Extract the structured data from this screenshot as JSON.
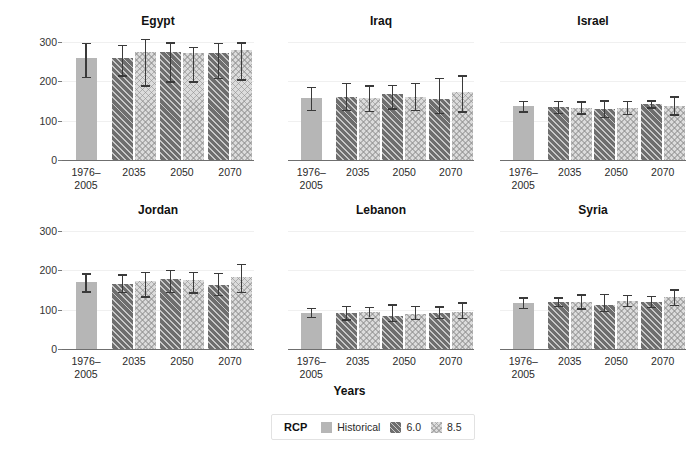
{
  "chart_data": {
    "type": "bar",
    "title": "",
    "xlabel": "Years",
    "ylabel": "Consecutive days without precipitation",
    "ylim": [
      0,
      320
    ],
    "yticks": [
      0,
      100,
      200,
      300
    ],
    "grid": false,
    "legend_position": "bottom-center",
    "legend_title": "RCP",
    "categories": [
      "1976–2005",
      "2035",
      "2050",
      "2070"
    ],
    "series_names": [
      "Historical",
      "6.0",
      "8.5"
    ],
    "panels": [
      {
        "name": "Egypt",
        "series": [
          {
            "name": "Historical",
            "values": [
              259,
              null,
              null,
              null
            ],
            "err_low": [
              212,
              null,
              null,
              null
            ],
            "err_high": [
              297,
              null,
              null,
              null
            ]
          },
          {
            "name": "6.0",
            "values": [
              null,
              259,
              274,
              272
            ],
            "err_low": [
              null,
              215,
              200,
              209
            ],
            "err_high": [
              null,
              293,
              299,
              297
            ]
          },
          {
            "name": "8.5",
            "values": [
              null,
              275,
              273,
              280
            ],
            "err_low": [
              null,
              190,
              200,
              205
            ],
            "err_high": [
              null,
              308,
              288,
              299
            ]
          }
        ]
      },
      {
        "name": "Iraq",
        "series": [
          {
            "name": "Historical",
            "values": [
              157,
              null,
              null,
              null
            ],
            "err_low": [
              128,
              null,
              null,
              null
            ],
            "err_high": [
              186,
              null,
              null,
              null
            ]
          },
          {
            "name": "6.0",
            "values": [
              null,
              160,
              168,
              155
            ],
            "err_low": [
              null,
              128,
              131,
              120
            ],
            "err_high": [
              null,
              196,
              191,
              208
            ]
          },
          {
            "name": "8.5",
            "values": [
              null,
              157,
              161,
              172
            ],
            "err_low": [
              null,
              125,
              128,
              124
            ],
            "err_high": [
              null,
              190,
              196,
              215
            ]
          }
        ]
      },
      {
        "name": "Israel",
        "series": [
          {
            "name": "Historical",
            "values": [
              137,
              null,
              null,
              null
            ],
            "err_low": [
              124,
              null,
              null,
              null
            ],
            "err_high": [
              151,
              null,
              null,
              null
            ]
          },
          {
            "name": "6.0",
            "values": [
              null,
              134,
              129,
              143
            ],
            "err_low": [
              null,
              120,
              110,
              134
            ],
            "err_high": [
              null,
              150,
              152,
              152
            ]
          },
          {
            "name": "8.5",
            "values": [
              null,
              133,
              131,
              138
            ],
            "err_low": [
              null,
              119,
              117,
              116
            ],
            "err_high": [
              null,
              149,
              150,
              162
            ]
          }
        ]
      },
      {
        "name": "Jordan",
        "series": [
          {
            "name": "Historical",
            "values": [
              171,
              null,
              null,
              null
            ],
            "err_low": [
              147,
              null,
              null,
              null
            ],
            "err_high": [
              192,
              null,
              null,
              null
            ]
          },
          {
            "name": "6.0",
            "values": [
              null,
              164,
              177,
              163
            ],
            "err_low": [
              null,
              145,
              146,
              138
            ],
            "err_high": [
              null,
              190,
              201,
              194
            ]
          },
          {
            "name": "8.5",
            "values": [
              null,
              172,
              176,
              184
            ],
            "err_low": [
              null,
              134,
              144,
              145
            ],
            "err_high": [
              null,
              196,
              196,
              216
            ]
          }
        ]
      },
      {
        "name": "Lebanon",
        "series": [
          {
            "name": "Historical",
            "values": [
              92,
              null,
              null,
              null
            ],
            "err_low": [
              82,
              null,
              null,
              null
            ],
            "err_high": [
              105,
              null,
              null,
              null
            ]
          },
          {
            "name": "6.0",
            "values": [
              null,
              91,
              84,
              91
            ],
            "err_low": [
              null,
              75,
              72,
              79
            ],
            "err_high": [
              null,
              110,
              114,
              108
            ]
          },
          {
            "name": "8.5",
            "values": [
              null,
              93,
              89,
              95
            ],
            "err_low": [
              null,
              80,
              76,
              79
            ],
            "err_high": [
              null,
              107,
              110,
              119
            ]
          }
        ]
      },
      {
        "name": "Syria",
        "series": [
          {
            "name": "Historical",
            "values": [
              118,
              null,
              null,
              null
            ],
            "err_low": [
              105,
              null,
              null,
              null
            ],
            "err_high": [
              131,
              null,
              null,
              null
            ]
          },
          {
            "name": "6.0",
            "values": [
              null,
              120,
              113,
              120
            ],
            "err_low": [
              null,
              110,
              97,
              107
            ],
            "err_high": [
              null,
              131,
              140,
              135
            ]
          },
          {
            "name": "8.5",
            "values": [
              null,
              119,
              122,
              131
            ],
            "err_low": [
              null,
              103,
              110,
              112
            ],
            "err_high": [
              null,
              139,
              138,
              152
            ]
          }
        ]
      }
    ]
  },
  "legend": {
    "title": "RCP",
    "items": [
      {
        "label": "Historical",
        "key": "hist"
      },
      {
        "label": "6.0",
        "key": "rcp60"
      },
      {
        "label": "8.5",
        "key": "rcp85"
      }
    ]
  },
  "colors": {
    "historical": "#b6b6b6",
    "rcp60": "#6e6e6e",
    "rcp85": "#dcdcdc",
    "error_bar": "#3a3a3a",
    "axis": "#6f6f6f",
    "text": "#1a1a1a"
  }
}
